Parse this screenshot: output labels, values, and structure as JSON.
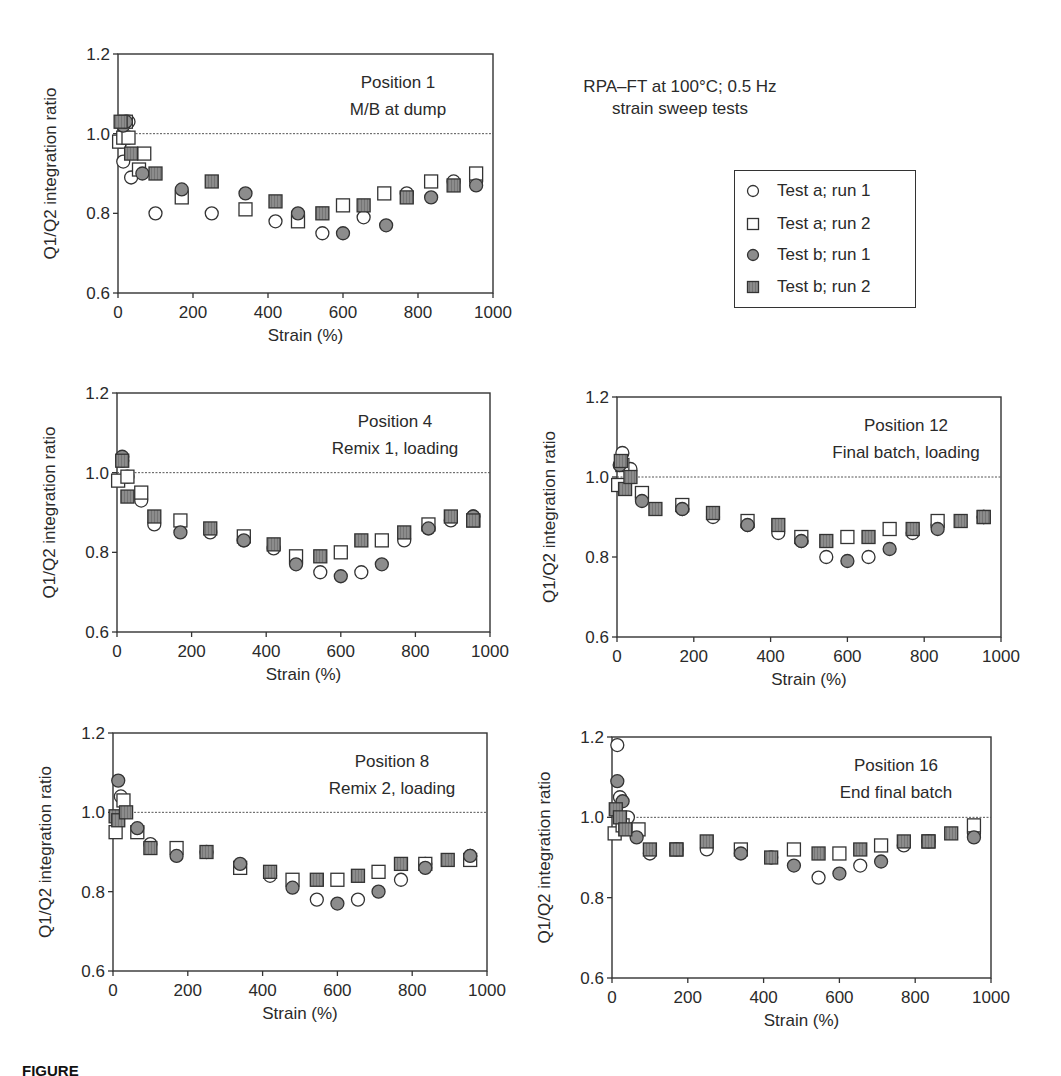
{
  "figure": {
    "note_line1": "RPA–FT at 100°C; 0.5 Hz",
    "note_line2": "strain sweep tests",
    "caption_partial": "FIGURE"
  },
  "legend": {
    "items": [
      {
        "label": "Test a; run 1",
        "marker": "open-circle"
      },
      {
        "label": "Test a; run 2",
        "marker": "open-square"
      },
      {
        "label": "Test b; run 1",
        "marker": "filled-circle"
      },
      {
        "label": "Test b; run 2",
        "marker": "filled-square"
      }
    ]
  },
  "colors": {
    "axis": "#333333",
    "marker_fill": "#8c8c8c",
    "marker_stroke": "#333333",
    "reference_line": "#555555"
  },
  "chart_data": [
    {
      "type": "scatter",
      "panel": "top-left",
      "title": "Position 1",
      "subtitle": "M/B at dump",
      "xlabel": "Strain (%)",
      "ylabel": "Q1/Q2 integration ratio",
      "xlim": [
        0,
        1000
      ],
      "ylim": [
        0.6,
        1.2
      ],
      "xticks": [
        "0",
        "200",
        "400",
        "600",
        "800",
        "1000"
      ],
      "yticks": [
        "0.6",
        "0.8",
        "1.0",
        "1.2"
      ],
      "reference_line_y": 1.0,
      "box": {
        "x0": 118,
        "x1": 493,
        "y0": 54,
        "y1": 293
      },
      "series": [
        {
          "name": "Test a; run 1",
          "points": [
            [
              7,
              0.98
            ],
            [
              14,
              0.93
            ],
            [
              28,
              1.03
            ],
            [
              35,
              0.89
            ],
            [
              100,
              0.8
            ],
            [
              250,
              0.8
            ],
            [
              420,
              0.78
            ],
            [
              545,
              0.75
            ],
            [
              655,
              0.79
            ],
            [
              770,
              0.85
            ],
            [
              895,
              0.88
            ],
            [
              955,
              0.88
            ]
          ]
        },
        {
          "name": "Test a; run 2",
          "points": [
            [
              3,
              0.98
            ],
            [
              14,
              0.99
            ],
            [
              21,
              1.03
            ],
            [
              28,
              0.99
            ],
            [
              56,
              0.91
            ],
            [
              70,
              0.95
            ],
            [
              170,
              0.84
            ],
            [
              340,
              0.81
            ],
            [
              480,
              0.78
            ],
            [
              600,
              0.82
            ],
            [
              710,
              0.85
            ],
            [
              835,
              0.88
            ],
            [
              955,
              0.9
            ]
          ]
        },
        {
          "name": "Test b; run 1",
          "points": [
            [
              14,
              1.02
            ],
            [
              21,
              1.03
            ],
            [
              65,
              0.9
            ],
            [
              170,
              0.86
            ],
            [
              340,
              0.85
            ],
            [
              480,
              0.8
            ],
            [
              600,
              0.75
            ],
            [
              715,
              0.77
            ],
            [
              835,
              0.84
            ],
            [
              955,
              0.87
            ]
          ]
        },
        {
          "name": "Test b; run 2",
          "points": [
            [
              7,
              1.03
            ],
            [
              35,
              0.95
            ],
            [
              100,
              0.9
            ],
            [
              250,
              0.88
            ],
            [
              420,
              0.83
            ],
            [
              545,
              0.8
            ],
            [
              655,
              0.82
            ],
            [
              770,
              0.84
            ],
            [
              895,
              0.87
            ]
          ]
        }
      ]
    },
    {
      "type": "scatter",
      "panel": "middle-left",
      "title": "Position 4",
      "subtitle": "Remix 1, loading",
      "xlabel": "Strain (%)",
      "ylabel": "Q1/Q2 integration ratio",
      "xlim": [
        0,
        1000
      ],
      "ylim": [
        0.6,
        1.2
      ],
      "xticks": [
        "0",
        "200",
        "400",
        "600",
        "800",
        "1000"
      ],
      "yticks": [
        "0.6",
        "0.8",
        "1.0",
        "1.2"
      ],
      "reference_line_y": 1.0,
      "box": {
        "x0": 117,
        "x1": 490,
        "y0": 393,
        "y1": 632
      },
      "series": [
        {
          "name": "Test a; run 1",
          "points": [
            [
              14,
              1.03
            ],
            [
              28,
              0.99
            ],
            [
              65,
              0.93
            ],
            [
              100,
              0.87
            ],
            [
              250,
              0.85
            ],
            [
              340,
              0.83
            ],
            [
              420,
              0.81
            ],
            [
              545,
              0.75
            ],
            [
              655,
              0.75
            ],
            [
              770,
              0.83
            ],
            [
              835,
              0.86
            ],
            [
              895,
              0.88
            ],
            [
              955,
              0.89
            ]
          ]
        },
        {
          "name": "Test a; run 2",
          "points": [
            [
              3,
              0.98
            ],
            [
              28,
              0.99
            ],
            [
              65,
              0.95
            ],
            [
              170,
              0.88
            ],
            [
              340,
              0.84
            ],
            [
              480,
              0.79
            ],
            [
              600,
              0.8
            ],
            [
              710,
              0.83
            ],
            [
              835,
              0.87
            ],
            [
              955,
              0.88
            ]
          ]
        },
        {
          "name": "Test b; run 1",
          "points": [
            [
              14,
              1.04
            ],
            [
              170,
              0.85
            ],
            [
              340,
              0.83
            ],
            [
              480,
              0.77
            ],
            [
              600,
              0.74
            ],
            [
              710,
              0.77
            ],
            [
              835,
              0.86
            ],
            [
              955,
              0.89
            ]
          ]
        },
        {
          "name": "Test b; run 2",
          "points": [
            [
              14,
              1.03
            ],
            [
              28,
              0.94
            ],
            [
              100,
              0.89
            ],
            [
              250,
              0.86
            ],
            [
              420,
              0.82
            ],
            [
              545,
              0.79
            ],
            [
              655,
              0.83
            ],
            [
              770,
              0.85
            ],
            [
              895,
              0.89
            ],
            [
              955,
              0.88
            ]
          ]
        }
      ]
    },
    {
      "type": "scatter",
      "panel": "middle-right",
      "title": "Position 12",
      "subtitle": "Final batch, loading",
      "xlabel": "Strain (%)",
      "ylabel": "Q1/Q2 integration ratio",
      "xlim": [
        0,
        1000
      ],
      "ylim": [
        0.6,
        1.2
      ],
      "xticks": [
        "0",
        "200",
        "400",
        "600",
        "800",
        "1000"
      ],
      "yticks": [
        "0.6",
        "0.8",
        "1.0",
        "1.2"
      ],
      "reference_line_y": 1.0,
      "box": {
        "x0": 617,
        "x1": 1001,
        "y0": 397,
        "y1": 637
      },
      "series": [
        {
          "name": "Test a; run 1",
          "points": [
            [
              14,
              1.06
            ],
            [
              35,
              1.02
            ],
            [
              65,
              0.95
            ],
            [
              170,
              0.92
            ],
            [
              250,
              0.9
            ],
            [
              340,
              0.88
            ],
            [
              420,
              0.86
            ],
            [
              480,
              0.84
            ],
            [
              545,
              0.8
            ],
            [
              655,
              0.8
            ],
            [
              770,
              0.86
            ],
            [
              835,
              0.88
            ],
            [
              955,
              0.9
            ]
          ]
        },
        {
          "name": "Test a; run 2",
          "points": [
            [
              3,
              0.98
            ],
            [
              14,
              1.03
            ],
            [
              65,
              0.96
            ],
            [
              170,
              0.93
            ],
            [
              340,
              0.89
            ],
            [
              480,
              0.85
            ],
            [
              600,
              0.85
            ],
            [
              710,
              0.87
            ],
            [
              835,
              0.89
            ],
            [
              955,
              0.9
            ]
          ]
        },
        {
          "name": "Test b; run 1",
          "points": [
            [
              7,
              1.03
            ],
            [
              65,
              0.94
            ],
            [
              170,
              0.92
            ],
            [
              340,
              0.88
            ],
            [
              480,
              0.84
            ],
            [
              600,
              0.79
            ],
            [
              710,
              0.82
            ],
            [
              835,
              0.87
            ],
            [
              955,
              0.9
            ]
          ]
        },
        {
          "name": "Test b; run 2",
          "points": [
            [
              10,
              1.04
            ],
            [
              21,
              0.97
            ],
            [
              35,
              1.0
            ],
            [
              100,
              0.92
            ],
            [
              250,
              0.91
            ],
            [
              420,
              0.88
            ],
            [
              545,
              0.84
            ],
            [
              655,
              0.85
            ],
            [
              770,
              0.87
            ],
            [
              895,
              0.89
            ],
            [
              955,
              0.9
            ]
          ]
        }
      ]
    },
    {
      "type": "scatter",
      "panel": "bottom-left",
      "title": "Position 8",
      "subtitle": "Remix 2, loading",
      "xlabel": "Strain (%)",
      "ylabel": "Q1/Q2 integration ratio",
      "xlim": [
        0,
        1000
      ],
      "ylim": [
        0.6,
        1.2
      ],
      "xticks": [
        "0",
        "200",
        "400",
        "600",
        "800",
        "1000"
      ],
      "yticks": [
        "0.6",
        "0.8",
        "1.0",
        "1.2"
      ],
      "reference_line_y": 1.0,
      "box": {
        "x0": 113,
        "x1": 487,
        "y0": 733,
        "y1": 971
      },
      "series": [
        {
          "name": "Test a; run 1",
          "points": [
            [
              21,
              1.04
            ],
            [
              100,
              0.92
            ],
            [
              250,
              0.9
            ],
            [
              420,
              0.84
            ],
            [
              545,
              0.78
            ],
            [
              655,
              0.78
            ],
            [
              770,
              0.83
            ],
            [
              835,
              0.87
            ],
            [
              955,
              0.89
            ]
          ]
        },
        {
          "name": "Test a; run 2",
          "points": [
            [
              7,
              0.95
            ],
            [
              28,
              1.03
            ],
            [
              65,
              0.95
            ],
            [
              170,
              0.91
            ],
            [
              340,
              0.86
            ],
            [
              480,
              0.83
            ],
            [
              600,
              0.83
            ],
            [
              710,
              0.85
            ],
            [
              835,
              0.87
            ],
            [
              955,
              0.88
            ]
          ]
        },
        {
          "name": "Test b; run 1",
          "points": [
            [
              14,
              1.08
            ],
            [
              65,
              0.96
            ],
            [
              170,
              0.89
            ],
            [
              340,
              0.87
            ],
            [
              480,
              0.81
            ],
            [
              600,
              0.77
            ],
            [
              710,
              0.8
            ],
            [
              835,
              0.86
            ],
            [
              955,
              0.89
            ]
          ]
        },
        {
          "name": "Test b; run 2",
          "points": [
            [
              7,
              0.99
            ],
            [
              14,
              0.98
            ],
            [
              35,
              1.0
            ],
            [
              100,
              0.91
            ],
            [
              250,
              0.9
            ],
            [
              420,
              0.85
            ],
            [
              545,
              0.83
            ],
            [
              655,
              0.84
            ],
            [
              770,
              0.87
            ],
            [
              895,
              0.88
            ]
          ]
        }
      ]
    },
    {
      "type": "scatter",
      "panel": "bottom-right",
      "title": "Position 16",
      "subtitle": "End final batch",
      "xlabel": "Strain (%)",
      "ylabel": "Q1/Q2 integration ratio",
      "xlim": [
        0,
        1000
      ],
      "ylim": [
        0.6,
        1.2
      ],
      "xticks": [
        "0",
        "200",
        "400",
        "600",
        "800",
        "1000"
      ],
      "yticks": [
        "0.6",
        "0.8",
        "1.0",
        "1.2"
      ],
      "reference_line_y": 1.0,
      "box": {
        "x0": 612,
        "x1": 991,
        "y0": 737,
        "y1": 978
      },
      "series": [
        {
          "name": "Test a; run 1",
          "points": [
            [
              14,
              1.18
            ],
            [
              21,
              1.05
            ],
            [
              42,
              1.0
            ],
            [
              100,
              0.91
            ],
            [
              250,
              0.92
            ],
            [
              420,
              0.9
            ],
            [
              545,
              0.85
            ],
            [
              655,
              0.88
            ],
            [
              770,
              0.93
            ],
            [
              955,
              0.96
            ]
          ]
        },
        {
          "name": "Test a; run 2",
          "points": [
            [
              7,
              0.96
            ],
            [
              28,
              0.98
            ],
            [
              70,
              0.97
            ],
            [
              170,
              0.92
            ],
            [
              340,
              0.92
            ],
            [
              480,
              0.92
            ],
            [
              600,
              0.91
            ],
            [
              710,
              0.93
            ],
            [
              835,
              0.94
            ],
            [
              955,
              0.98
            ]
          ]
        },
        {
          "name": "Test b; run 1",
          "points": [
            [
              14,
              1.09
            ],
            [
              28,
              1.04
            ],
            [
              65,
              0.95
            ],
            [
              170,
              0.92
            ],
            [
              340,
              0.91
            ],
            [
              480,
              0.88
            ],
            [
              600,
              0.86
            ],
            [
              710,
              0.89
            ],
            [
              835,
              0.94
            ],
            [
              955,
              0.95
            ]
          ]
        },
        {
          "name": "Test b; run 2",
          "points": [
            [
              10,
              1.02
            ],
            [
              21,
              1.0
            ],
            [
              35,
              0.97
            ],
            [
              100,
              0.92
            ],
            [
              170,
              0.92
            ],
            [
              250,
              0.94
            ],
            [
              420,
              0.9
            ],
            [
              545,
              0.91
            ],
            [
              655,
              0.92
            ],
            [
              770,
              0.94
            ],
            [
              835,
              0.94
            ],
            [
              895,
              0.96
            ]
          ]
        }
      ]
    }
  ]
}
